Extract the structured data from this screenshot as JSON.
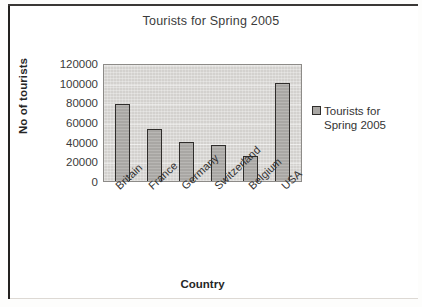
{
  "chart_data": {
    "type": "bar",
    "title": "Tourists for Spring 2005",
    "xlabel": "Country",
    "ylabel": "No of tourists",
    "categories": [
      "Britain",
      "France",
      "Germany",
      "Switzerland",
      "Belgium",
      "USA"
    ],
    "values": [
      78000,
      53000,
      40000,
      37000,
      25000,
      100000
    ],
    "series": [
      {
        "name": "Tourists for Spring 2005",
        "values": [
          78000,
          53000,
          40000,
          37000,
          25000,
          100000
        ]
      }
    ],
    "ylim": [
      0,
      120000
    ],
    "ytick_labels": [
      "120000",
      "100000",
      "80000",
      "60000",
      "40000",
      "20000",
      "0"
    ],
    "ytick_values": [
      120000,
      100000,
      80000,
      60000,
      40000,
      20000,
      0
    ],
    "grid": true,
    "legend_position": "right",
    "legend_entries": [
      "Tourists for Spring 2005"
    ],
    "colors": {
      "bar_fill": "#a9a7a4",
      "bar_border": "#2f2d2b",
      "plot_background": "#d3d1ce",
      "plot_border": "#8d8b88",
      "text": "#333333",
      "page_background": "#ffffff"
    }
  },
  "legend": {
    "label_line1": "Tourists for",
    "label_line2": "Spring 2005",
    "swatch_icon": "legend-square-icon"
  }
}
